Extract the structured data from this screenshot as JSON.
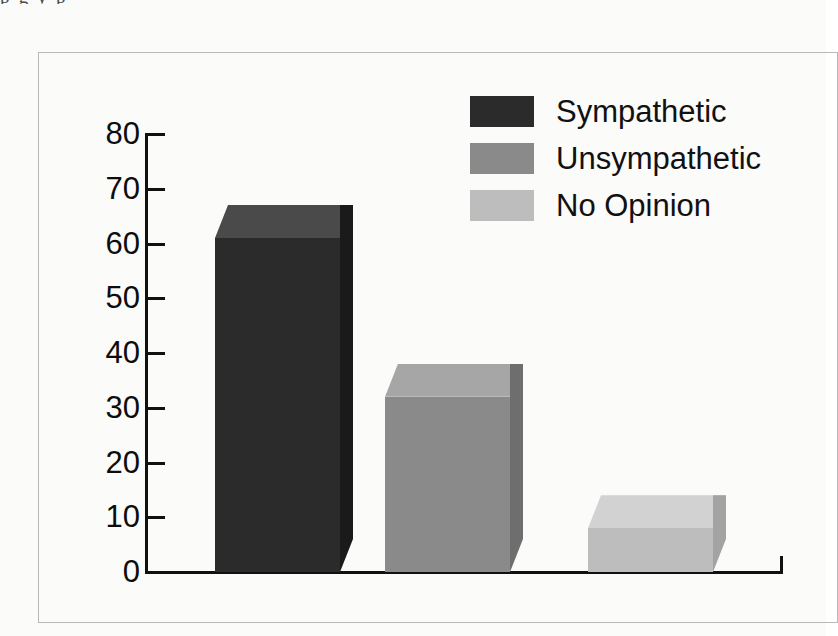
{
  "scan_artifact": {
    "text": "p g y p"
  },
  "legend": {
    "position": "top-right",
    "items": [
      {
        "label": "Sympathetic",
        "color": "#2b2b2b",
        "top_color": "#4a4a4a",
        "side_color": "#1a1a1a"
      },
      {
        "label": "Unsympathetic",
        "color": "#8a8a8a",
        "top_color": "#a6a6a6",
        "side_color": "#6e6e6e"
      },
      {
        "label": "No Opinion",
        "color": "#bdbdbd",
        "top_color": "#d2d2d2",
        "side_color": "#a3a3a3"
      }
    ]
  },
  "axis": {
    "y_ticks": [
      "80",
      "70",
      "60",
      "50",
      "40",
      "30",
      "20",
      "10",
      "0"
    ],
    "y_min": 0,
    "y_max": 80,
    "y_step": 10
  },
  "chart_data": {
    "type": "bar",
    "title": "",
    "subtitle": "",
    "xlabel": "",
    "ylabel": "",
    "categories": [
      "Sympathetic",
      "Unsympathetic",
      "No Opinion"
    ],
    "values": [
      61,
      32,
      8
    ],
    "series": [
      {
        "name": "Poll response",
        "values": [
          61,
          32,
          8
        ]
      }
    ],
    "ylim": [
      0,
      80
    ],
    "ytick_labels": [
      "0",
      "10",
      "20",
      "30",
      "40",
      "50",
      "60",
      "70",
      "80"
    ],
    "xtick_labels": [],
    "grid": false,
    "legend_position": "top-right",
    "style": "3d-rectangular-bars",
    "colors": [
      "#2b2b2b",
      "#8a8a8a",
      "#bdbdbd"
    ]
  }
}
